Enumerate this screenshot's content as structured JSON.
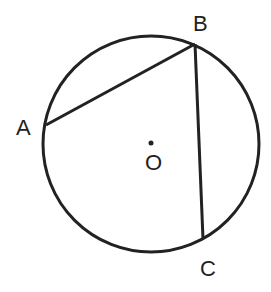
{
  "diagram": {
    "type": "circle-inscribed-angle",
    "circle": {
      "center_label": "O",
      "cx": 151,
      "cy": 144,
      "r": 108
    },
    "points": [
      {
        "name": "A",
        "x": 46,
        "y": 125,
        "label_x": 16,
        "label_y": 135
      },
      {
        "name": "B",
        "x": 195,
        "y": 44,
        "label_x": 193,
        "label_y": 30
      },
      {
        "name": "C",
        "x": 203,
        "y": 239,
        "label_x": 200,
        "label_y": 276
      }
    ],
    "center": {
      "name": "O",
      "x": 151,
      "y": 143,
      "label_x": 145,
      "label_y": 170
    },
    "segments": [
      {
        "from": "A",
        "to": "B"
      },
      {
        "from": "B",
        "to": "C"
      }
    ],
    "stroke_color": "#222222"
  }
}
